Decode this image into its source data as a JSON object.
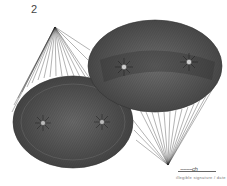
{
  "figure": {
    "number_label": "2",
    "colors": {
      "background": "#ffffff",
      "line": "#222222",
      "fill": "#555555"
    }
  },
  "signature": {
    "scrawl": "~~~~ch",
    "caption": "illegible signature / date"
  }
}
